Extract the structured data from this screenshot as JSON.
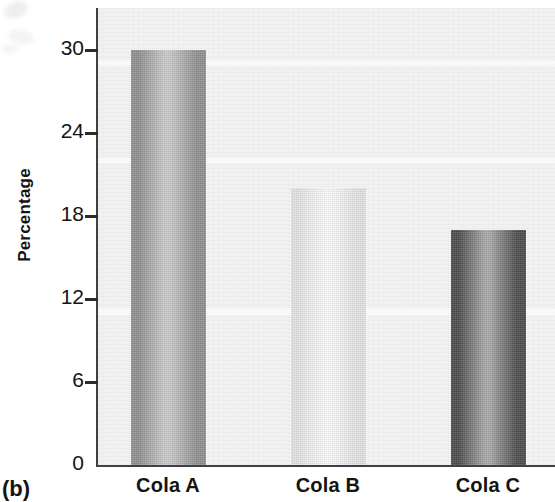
{
  "figure": {
    "label": "(b)"
  },
  "chart_data": {
    "type": "bar",
    "title": "",
    "subtitle": "",
    "xlabel": "",
    "ylabel": "Percentage",
    "categories": [
      "Cola A",
      "Cola B",
      "Cola C"
    ],
    "values": [
      30,
      20,
      17
    ],
    "ylim": [
      0,
      33
    ],
    "yticks": [
      0,
      6,
      12,
      18,
      24,
      30
    ],
    "ytick_labels": [
      "0",
      "6",
      "12",
      "18",
      "24",
      "30"
    ],
    "grid": false,
    "legend": "none",
    "series": [
      {
        "name": "Percentage",
        "values": [
          30,
          20,
          17
        ]
      }
    ],
    "bar_colors": [
      "#8f8f8f",
      "#e3e3e3",
      "#4a4a4a"
    ],
    "bar_highlight_colors": [
      "#c9c9c9",
      "#fafafa",
      "#a8a8a8"
    ],
    "plot_background": "#f1f1f1",
    "axis_color": "#404040",
    "text_color": "#141414"
  }
}
